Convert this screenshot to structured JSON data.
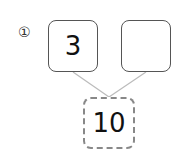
{
  "problem": {
    "label": "①",
    "parts": [
      {
        "value": "3"
      },
      {
        "value": ""
      }
    ],
    "total": {
      "value": "10"
    }
  },
  "colors": {
    "box_border": "#555555",
    "total_border": "#888888",
    "connector": "#bbbbbb"
  }
}
